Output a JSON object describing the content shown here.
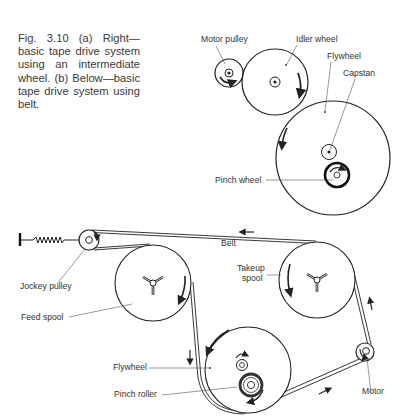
{
  "caption": "Fig. 3.10 (a) Right—basic tape drive system using an intermediate wheel. (b) Below—basic tape drive system using belt.",
  "diagram_a": {
    "labels": {
      "motor_pulley": "Motor pulley",
      "idler_wheel": "Idler wheel",
      "flywheel": "Flywheel",
      "capstan": "Capstan",
      "pinch_wheel": "Pinch wheel"
    }
  },
  "diagram_b": {
    "labels": {
      "belt": "Belt",
      "jockey_pulley": "Jockey pulley",
      "feed_spool": "Feed spool",
      "takeup_spool_line1": "Takeup",
      "takeup_spool_line2": "spool",
      "flywheel": "Flywheel",
      "pinch_roller": "Pinch roller",
      "motor": "Motor"
    }
  },
  "colors": {
    "ink": "#222222",
    "text": "#333333",
    "background": "#ffffff"
  }
}
